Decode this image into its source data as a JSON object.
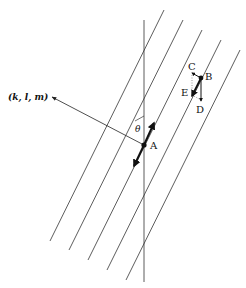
{
  "diagram": {
    "type": "crystal lattice planes with normal vector",
    "normal_label": "(k, l, m)",
    "angle_label": "θ",
    "points": [
      {
        "id": "A",
        "label": "A"
      },
      {
        "id": "B",
        "label": "B"
      },
      {
        "id": "C",
        "label": "C"
      },
      {
        "id": "D",
        "label": "D"
      },
      {
        "id": "E",
        "label": "E"
      }
    ],
    "parallel_planes_count": 5,
    "colors": {
      "line": "#222222",
      "background": "#ffffff"
    }
  }
}
